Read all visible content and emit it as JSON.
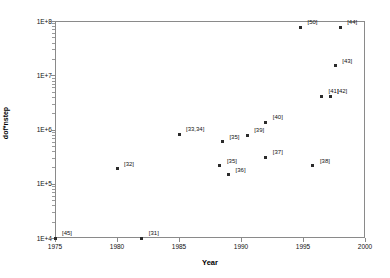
{
  "chart_data": {
    "type": "scatter",
    "title": "",
    "xlabel": "Year",
    "ylabel": "dof*nstep",
    "xlim": [
      1975,
      2000
    ],
    "ylim": [
      10000,
      100000000
    ],
    "yscale": "log",
    "xticks": [
      "1975",
      "1980",
      "1985",
      "1990",
      "1995",
      "2000"
    ],
    "xtick_values": [
      1975,
      1980,
      1985,
      1990,
      1995,
      2000
    ],
    "yticks": [
      "1E+4",
      "1E+5",
      "1E+6",
      "1E+7",
      "1E+8"
    ],
    "ytick_values": [
      10000,
      100000,
      1000000,
      10000000,
      100000000
    ],
    "grid": false,
    "legend": "none",
    "points": [
      {
        "label": "[45]",
        "x": 1975.0,
        "y": 10000,
        "lx": 4,
        "ly": -4
      },
      {
        "label": "[31]",
        "x": 1982.0,
        "y": 10000,
        "lx": 4,
        "ly": -4
      },
      {
        "label": "[32]",
        "x": 1980.0,
        "y": 190000,
        "lx": 4,
        "ly": -4
      },
      {
        "label": "[33,34]",
        "x": 1985.0,
        "y": 820000,
        "lx": 4,
        "ly": -4
      },
      {
        "label": "[35]",
        "x": 1988.5,
        "y": 600000,
        "lx": 4,
        "ly": -4
      },
      {
        "label": "[36]",
        "x": 1989.0,
        "y": 145000,
        "lx": 4,
        "ly": -4
      },
      {
        "label": "[35]",
        "x": 1988.3,
        "y": 215000,
        "lx": 4,
        "ly": -4
      },
      {
        "label": "[39]",
        "x": 1990.5,
        "y": 780000,
        "lx": 4,
        "ly": -4
      },
      {
        "label": "[40]",
        "x": 1992.0,
        "y": 1350000,
        "lx": 4,
        "ly": -4
      },
      {
        "label": "[37]",
        "x": 1992.0,
        "y": 310000,
        "lx": 4,
        "ly": -4
      },
      {
        "label": "[38]",
        "x": 1995.8,
        "y": 215000,
        "lx": 4,
        "ly": -4
      },
      {
        "label": "[50]",
        "x": 1994.8,
        "y": 76000000,
        "lx": 4,
        "ly": -4
      },
      {
        "label": "[44]",
        "x": 1998.0,
        "y": 76000000,
        "lx": 4,
        "ly": -4
      },
      {
        "label": "[43]",
        "x": 1997.6,
        "y": 15000000,
        "lx": 4,
        "ly": -4
      },
      {
        "label": "[41]",
        "x": 1996.5,
        "y": 4100000,
        "lx": 4,
        "ly": -4
      },
      {
        "label": "[42]",
        "x": 1997.2,
        "y": 4100000,
        "lx": 4,
        "ly": -4
      }
    ]
  }
}
